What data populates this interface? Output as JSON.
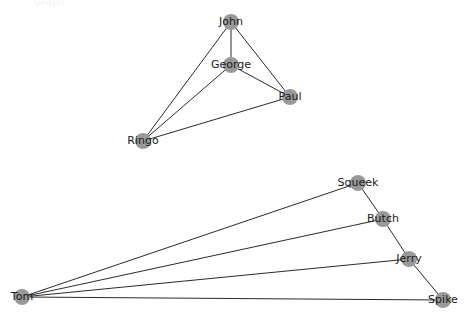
{
  "figure": {
    "background_color": "#ffffff",
    "node_color": "#999999",
    "edge_color": "#2b2b2b",
    "label_color": "#1a1a1a",
    "node_radius": 8,
    "width": 468,
    "height": 319,
    "top_artifact_text": "Graph"
  },
  "chart_data": {
    "type": "diagram",
    "subtype": "node-link-graph",
    "title": "",
    "graphs": [
      {
        "name": "beatles-graph",
        "nodes": [
          {
            "id": "John",
            "label": "John",
            "x": 231,
            "y": 22,
            "r": 8
          },
          {
            "id": "George",
            "label": "George",
            "x": 231,
            "y": 65,
            "r": 8
          },
          {
            "id": "Paul",
            "label": "Paul",
            "x": 290,
            "y": 97,
            "r": 8
          },
          {
            "id": "Ringo",
            "label": "Ringo",
            "x": 143,
            "y": 141,
            "r": 8
          }
        ],
        "edges": [
          {
            "source": "John",
            "target": "George"
          },
          {
            "source": "John",
            "target": "Paul"
          },
          {
            "source": "John",
            "target": "Ringo"
          },
          {
            "source": "George",
            "target": "Paul"
          },
          {
            "source": "George",
            "target": "Ringo"
          },
          {
            "source": "Ringo",
            "target": "Paul"
          }
        ]
      },
      {
        "name": "tom-and-jerry-graph",
        "nodes": [
          {
            "id": "Squeek",
            "label": "Squeek",
            "x": 358,
            "y": 183,
            "r": 8
          },
          {
            "id": "Butch",
            "label": "Butch",
            "x": 383,
            "y": 219,
            "r": 8
          },
          {
            "id": "Jerry",
            "label": "Jerry",
            "x": 409,
            "y": 259,
            "r": 8
          },
          {
            "id": "Tom",
            "label": "Tom",
            "x": 22,
            "y": 297,
            "r": 8
          },
          {
            "id": "Spike",
            "label": "Spike",
            "x": 443,
            "y": 300,
            "r": 8
          }
        ],
        "edges": [
          {
            "source": "Tom",
            "target": "Squeek"
          },
          {
            "source": "Tom",
            "target": "Butch"
          },
          {
            "source": "Tom",
            "target": "Jerry"
          },
          {
            "source": "Tom",
            "target": "Spike"
          },
          {
            "source": "Squeek",
            "target": "Butch"
          },
          {
            "source": "Butch",
            "target": "Jerry"
          },
          {
            "source": "Jerry",
            "target": "Spike"
          }
        ]
      }
    ]
  }
}
